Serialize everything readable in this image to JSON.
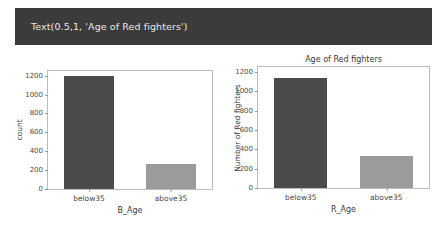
{
  "repr_output": {
    "text": "Text(0.5,1, 'Age of Red fighters')",
    "background": "#3b3b3b",
    "foreground": "#e9e9e9"
  },
  "colors": {
    "bar_dark": "#4b4b4b",
    "bar_light": "#9b9b9b",
    "axis": "#bdbdbd",
    "text": "#3a3a3a"
  },
  "chart_data": [
    {
      "type": "bar",
      "title": "",
      "xlabel": "B_Age",
      "ylabel": "count",
      "categories": [
        "below35",
        "above35"
      ],
      "values": [
        1198,
        268
      ],
      "ylim": [
        0,
        1250
      ],
      "yticks": [
        0,
        200,
        400,
        600,
        800,
        1000,
        1200
      ],
      "ytick_labels": [
        "0",
        "200",
        "400",
        "600",
        "800",
        "1000",
        "1200"
      ],
      "bar_colors": [
        "#4b4b4b",
        "#9b9b9b"
      ],
      "grid": false,
      "legend": "none"
    },
    {
      "type": "bar",
      "title": "Age of Red fighters",
      "xlabel": "R_Age",
      "ylabel": "Number of Red fighters",
      "categories": [
        "below35",
        "above35"
      ],
      "values": [
        1140,
        332
      ],
      "ylim": [
        0,
        1250
      ],
      "yticks": [
        0,
        200,
        400,
        600,
        800,
        1000,
        1200
      ],
      "ytick_labels": [
        "0",
        "200",
        "400",
        "600",
        "800",
        "1000",
        "1200"
      ],
      "bar_colors": [
        "#4b4b4b",
        "#9b9b9b"
      ],
      "grid": false,
      "legend": "none"
    }
  ]
}
